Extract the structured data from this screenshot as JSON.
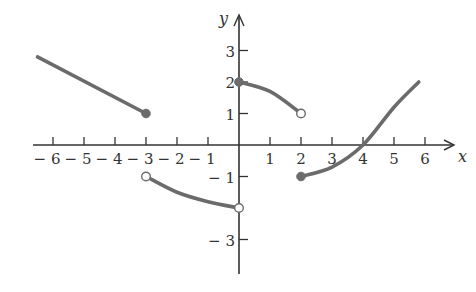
{
  "chart_data": {
    "type": "line",
    "title": "",
    "xlabel": "x",
    "ylabel": "y",
    "xlim": [
      -6.5,
      6.8
    ],
    "ylim": [
      -3.8,
      4.0
    ],
    "grid": false,
    "x_ticks": [
      -6,
      -5,
      -4,
      -3,
      -2,
      -1,
      1,
      2,
      3,
      4,
      5,
      6
    ],
    "x_tick_labels": [
      "− 6",
      "− 5",
      "− 4",
      "− 3",
      "− 2",
      "− 1",
      "1",
      "2",
      "3",
      "4",
      "5",
      "6"
    ],
    "y_ticks": [
      3,
      2,
      1,
      -1,
      -3
    ],
    "y_tick_labels": [
      "3",
      "2",
      "1",
      "− 1",
      "− 3"
    ],
    "series": [
      {
        "name": "segment-1",
        "shape": "line",
        "points": [
          [
            -6.5,
            2.8
          ],
          [
            -3,
            1
          ]
        ],
        "endpoints": [
          {
            "x": -3,
            "y": 1,
            "closed": true
          }
        ]
      },
      {
        "name": "segment-2",
        "shape": "curve",
        "points": [
          [
            -3,
            -1
          ],
          [
            -2,
            -1.5
          ],
          [
            -1,
            -1.8
          ],
          [
            0,
            -2
          ]
        ],
        "endpoints": [
          {
            "x": -3,
            "y": -1,
            "closed": false
          },
          {
            "x": 0,
            "y": -2,
            "closed": false
          }
        ]
      },
      {
        "name": "segment-3",
        "shape": "curve",
        "points": [
          [
            0,
            2
          ],
          [
            1,
            1.7
          ],
          [
            2,
            1
          ]
        ],
        "endpoints": [
          {
            "x": 0,
            "y": 2,
            "closed": true
          },
          {
            "x": 2,
            "y": 1,
            "closed": false
          }
        ]
      },
      {
        "name": "segment-4",
        "shape": "curve",
        "points": [
          [
            2,
            -1
          ],
          [
            3,
            -0.7
          ],
          [
            4,
            0
          ],
          [
            5,
            1.2
          ],
          [
            5.8,
            2
          ]
        ],
        "endpoints": [
          {
            "x": 2,
            "y": -1,
            "closed": true
          }
        ]
      }
    ]
  },
  "style": {
    "curve_color": "#6b6b6b",
    "axis_color": "#333333"
  }
}
